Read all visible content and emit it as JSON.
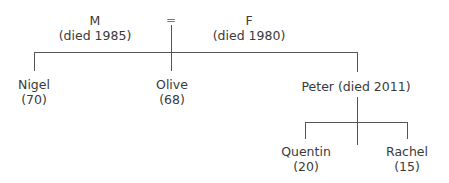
{
  "diagram": {
    "type": "family-tree",
    "marriage_symbol": "=",
    "parents": [
      {
        "id": "M",
        "name": "M",
        "detail": "(died 1985)"
      },
      {
        "id": "F",
        "name": "F",
        "detail": "(died 1980)"
      }
    ],
    "children": [
      {
        "id": "nigel",
        "name": "Nigel",
        "detail": "(70)"
      },
      {
        "id": "olive",
        "name": "Olive",
        "detail": "(68)"
      },
      {
        "id": "peter",
        "name": "Peter (died 2011)",
        "detail": ""
      }
    ],
    "grandchildren": [
      {
        "id": "quentin",
        "parent": "peter",
        "name": "Quentin",
        "detail": "(20)"
      },
      {
        "id": "rachel",
        "parent": "peter",
        "name": "Rachel",
        "detail": "(15)"
      }
    ],
    "line_color": "#555555"
  }
}
